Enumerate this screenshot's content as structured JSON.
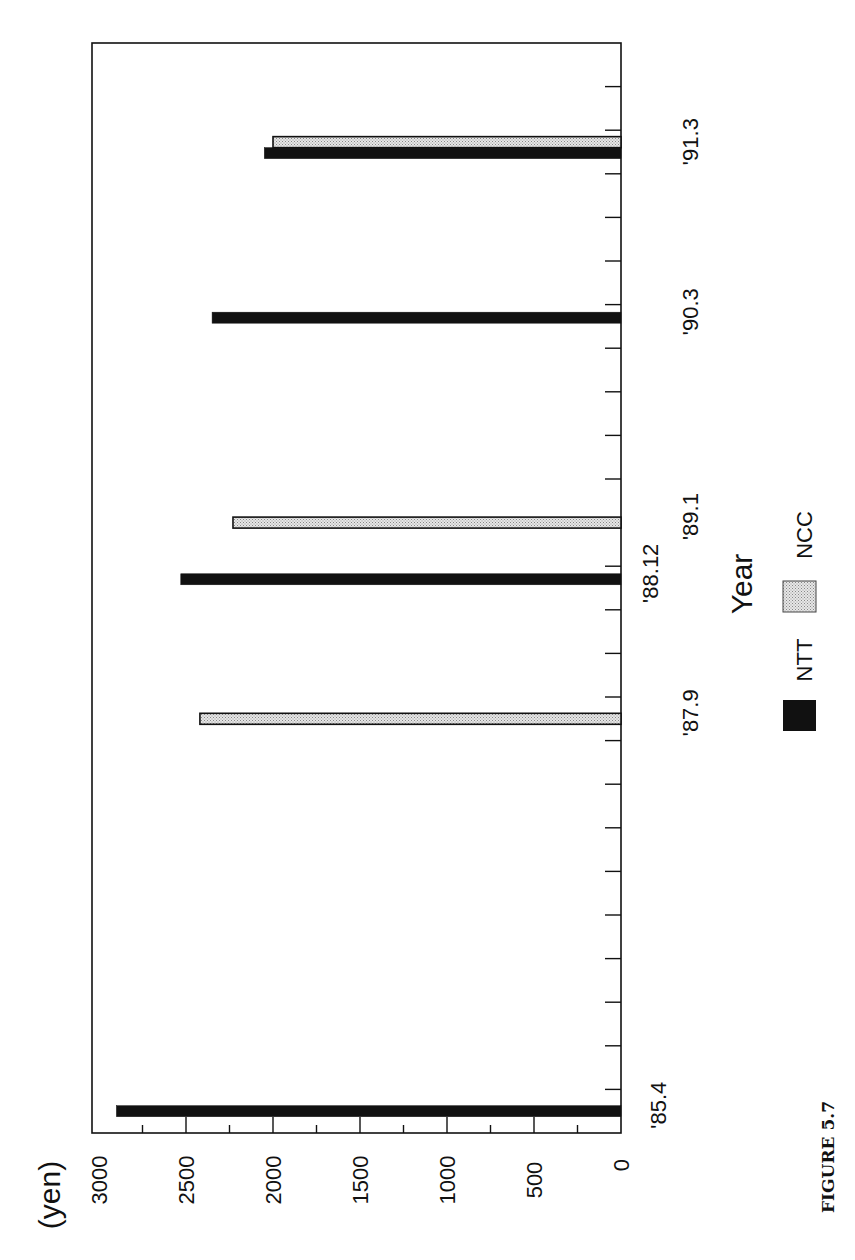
{
  "chart_data": {
    "type": "bar",
    "orientation": "rotated-90-ccw",
    "title": "",
    "figure_label": "FIGURE 5.7",
    "xlabel": "Year",
    "ylabel": "(yen)",
    "ylim": [
      0,
      3000
    ],
    "yticks": [
      0,
      500,
      1000,
      1500,
      2000,
      2500,
      3000
    ],
    "ytick_labels": [
      "0",
      "500",
      "1000",
      "1500",
      "2000",
      "2500",
      "3000"
    ],
    "grid": false,
    "legend": {
      "position": "bottom",
      "entries": [
        {
          "name": "NTT",
          "color": "#111111",
          "pattern": "solid"
        },
        {
          "name": "NCC",
          "color": "#d0d0d0",
          "pattern": "stipple"
        }
      ]
    },
    "categories": [
      "'85.4",
      "'87.9",
      "'88.12",
      "'89.1",
      "'90.3",
      "'91.3"
    ],
    "category_axis_slots": 25,
    "category_positions": [
      0.5,
      9.5,
      12.7,
      14.0,
      18.7,
      22.6
    ],
    "series": [
      {
        "name": "NTT",
        "values": [
          2900,
          null,
          2530,
          null,
          2350,
          2050
        ]
      },
      {
        "name": "NCC",
        "values": [
          null,
          2420,
          null,
          2230,
          null,
          2000
        ]
      }
    ]
  }
}
